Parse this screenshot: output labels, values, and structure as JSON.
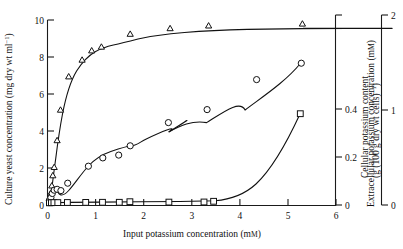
{
  "figure": {
    "background": "#ffffff",
    "ink": "#111111"
  },
  "axes": {
    "x": {
      "title_main": "Input potassium concentration (m",
      "title_smallcaps": "M",
      "title_tail": ")",
      "title_full": "Input potassium concentration (mM)",
      "min": 0,
      "max": 6,
      "ticks": [
        0,
        1,
        2,
        3,
        4,
        5,
        6
      ],
      "tick_labels": [
        "0",
        "1",
        "2",
        "3",
        "4",
        "5",
        "6"
      ]
    },
    "y_left": {
      "title_main": "Culture yeast concentration (mg dry wt ml",
      "title_sup": "−1",
      "title_tail": ")",
      "title_full": "Culture yeast concentration (mg dry wt ml⁻¹)",
      "min": 0,
      "max": 10,
      "ticks": [
        0,
        2,
        4,
        6,
        8,
        10
      ],
      "tick_labels": [
        "0",
        "2",
        "4",
        "6",
        "8",
        "10"
      ]
    },
    "y_right_inner": {
      "title_main": "Extracellular potassium concentration (m",
      "title_smallcaps": "M",
      "title_tail": ")",
      "title_full": "Extracellular potassium concentration (mM)",
      "min": 0,
      "max": 0.56,
      "ticks": [
        0,
        0.2,
        0.4
      ],
      "tick_labels": [
        "0",
        "0.2",
        "0.4"
      ]
    },
    "y_right_outer": {
      "title_line1": "Cellular potassium content",
      "title_line2_main": "(g (100 g dry wt cells)",
      "title_line2_sup": "−1",
      "title_line2_tail": ")",
      "title_full": "Cellular potassium content (g (100 g dry wt cells)⁻¹)",
      "min": 0,
      "max": 2,
      "ticks": [
        0,
        1,
        2
      ],
      "tick_labels": [
        "0",
        "1",
        "2"
      ]
    }
  },
  "chart_data": {
    "type": "scatter",
    "title": "",
    "xlabel": "Input potassium concentration (mM)",
    "ylabel": "Culture yeast concentration (mg dry wt ml⁻¹)",
    "ylabel_right_inner": "Extracellular potassium concentration (mM)",
    "ylabel_right_outer": "Cellular potassium content (g (100 g dry wt cells)⁻¹)",
    "xlim": [
      0,
      6
    ],
    "ylim": [
      0,
      10
    ],
    "ylim_right_inner": [
      0,
      0.56
    ],
    "ylim_right_outer": [
      0,
      2
    ],
    "grid": false,
    "legend": "none",
    "series": [
      {
        "name": "Cellular potassium content",
        "marker": "triangle",
        "axis": "y_right_outer",
        "units": "g (100 g dry wt cells)⁻¹",
        "points_display_left_scale": [
          [
            0.04,
            0.3
          ],
          [
            0.06,
            0.62
          ],
          [
            0.09,
            1.05
          ],
          [
            0.11,
            1.6
          ],
          [
            0.14,
            2.05
          ],
          [
            0.2,
            3.5
          ],
          [
            0.27,
            5.15
          ],
          [
            0.44,
            6.95
          ],
          [
            0.72,
            7.85
          ],
          [
            0.92,
            8.35
          ],
          [
            1.12,
            8.55
          ],
          [
            1.72,
            9.25
          ],
          [
            2.55,
            9.55
          ],
          [
            3.35,
            9.7
          ],
          [
            5.3,
            9.8
          ]
        ],
        "x": [
          0.04,
          0.06,
          0.09,
          0.11,
          0.14,
          0.2,
          0.27,
          0.44,
          0.72,
          0.92,
          1.12,
          1.72,
          2.55,
          3.35,
          5.3
        ],
        "y": [
          0.06,
          0.12,
          0.21,
          0.32,
          0.41,
          0.7,
          1.03,
          1.39,
          1.57,
          1.67,
          1.71,
          1.85,
          1.91,
          1.94,
          1.96
        ]
      },
      {
        "name": "Culture yeast concentration",
        "marker": "circle",
        "axis": "y_left",
        "units": "mg dry wt ml⁻¹",
        "x": [
          0.04,
          0.07,
          0.1,
          0.14,
          0.2,
          0.28,
          0.42,
          0.85,
          1.15,
          1.48,
          1.72,
          2.52,
          3.32,
          4.35,
          5.28
        ],
        "y": [
          0.25,
          0.4,
          0.62,
          0.8,
          0.85,
          0.78,
          1.15,
          2.1,
          2.55,
          2.7,
          3.2,
          4.45,
          5.15,
          6.55,
          7.65
        ]
      },
      {
        "name": "Extracellular potassium concentration",
        "marker": "square",
        "axis": "y_right_inner",
        "units": "mM",
        "x": [
          0.05,
          0.09,
          0.14,
          0.22,
          0.42,
          0.8,
          1.15,
          1.5,
          1.72,
          2.55,
          3.28,
          3.48,
          5.3
        ],
        "y": [
          0.012,
          0.013,
          0.014,
          0.015,
          0.016,
          0.017,
          0.018,
          0.018,
          0.019,
          0.019,
          0.02,
          0.022,
          0.385
        ]
      }
    ]
  }
}
